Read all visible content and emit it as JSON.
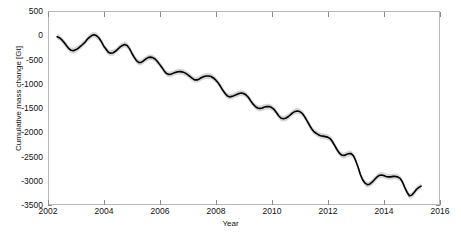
{
  "chart_data": {
    "type": "line",
    "title": "",
    "xlabel": "Year",
    "ylabel": "Cumulative mass change [Gt]",
    "xlim": [
      2002,
      2016
    ],
    "ylim": [
      -3500,
      500
    ],
    "xticks": [
      2002,
      2004,
      2006,
      2008,
      2010,
      2012,
      2014,
      2016
    ],
    "xtick_labels": [
      "2002",
      "2004",
      "2006",
      "2008",
      "2010",
      "2012",
      "2014",
      "2016"
    ],
    "yticks": [
      500,
      0,
      -500,
      -1000,
      -1500,
      -2000,
      -2500,
      -3000,
      -3500
    ],
    "ytick_labels": [
      "500",
      "0",
      "-500",
      "-1000",
      "-1500",
      "-2000",
      "-2500",
      "-3000",
      "-3500"
    ],
    "grid": false,
    "legend": null,
    "line_color": "#000000",
    "uncertainty_band_color": "#bdbdbd",
    "series": [
      {
        "name": "Cumulative mass change",
        "uncertainty": 60,
        "x": [
          2002.29,
          2002.37,
          2002.45,
          2002.54,
          2002.62,
          2002.7,
          2002.79,
          2002.87,
          2002.95,
          2003.04,
          2003.12,
          2003.2,
          2003.29,
          2003.37,
          2003.45,
          2003.54,
          2003.62,
          2003.7,
          2003.79,
          2003.87,
          2003.95,
          2004.04,
          2004.12,
          2004.2,
          2004.29,
          2004.37,
          2004.45,
          2004.54,
          2004.62,
          2004.7,
          2004.79,
          2004.87,
          2004.95,
          2005.04,
          2005.12,
          2005.2,
          2005.29,
          2005.37,
          2005.45,
          2005.54,
          2005.62,
          2005.7,
          2005.79,
          2005.87,
          2005.95,
          2006.04,
          2006.12,
          2006.2,
          2006.29,
          2006.37,
          2006.45,
          2006.54,
          2006.62,
          2006.7,
          2006.79,
          2006.87,
          2006.95,
          2007.04,
          2007.12,
          2007.2,
          2007.29,
          2007.37,
          2007.45,
          2007.54,
          2007.62,
          2007.7,
          2007.79,
          2007.87,
          2007.95,
          2008.04,
          2008.12,
          2008.2,
          2008.29,
          2008.37,
          2008.45,
          2008.54,
          2008.62,
          2008.7,
          2008.79,
          2008.87,
          2008.95,
          2009.04,
          2009.12,
          2009.2,
          2009.29,
          2009.37,
          2009.45,
          2009.54,
          2009.62,
          2009.7,
          2009.79,
          2009.87,
          2009.95,
          2010.04,
          2010.12,
          2010.2,
          2010.29,
          2010.37,
          2010.45,
          2010.54,
          2010.62,
          2010.7,
          2010.79,
          2010.87,
          2010.95,
          2011.04,
          2011.12,
          2011.2,
          2011.29,
          2011.37,
          2011.45,
          2011.54,
          2011.62,
          2011.7,
          2011.79,
          2011.87,
          2011.95,
          2012.04,
          2012.12,
          2012.2,
          2012.29,
          2012.37,
          2012.45,
          2012.54,
          2012.62,
          2012.7,
          2012.79,
          2012.87,
          2012.95,
          2013.04,
          2013.12,
          2013.2,
          2013.29,
          2013.37,
          2013.45,
          2013.54,
          2013.62,
          2013.7,
          2013.79,
          2013.87,
          2013.95,
          2014.04,
          2014.12,
          2014.2,
          2014.29,
          2014.37,
          2014.45,
          2014.54,
          2014.62,
          2014.7,
          2014.79,
          2014.87,
          2014.95,
          2015.04,
          2015.12,
          2015.2,
          2015.29
        ],
        "values": [
          -10,
          -30,
          -70,
          -130,
          -190,
          -250,
          -290,
          -300,
          -280,
          -250,
          -210,
          -170,
          -120,
          -60,
          -20,
          20,
          30,
          10,
          -40,
          -110,
          -200,
          -270,
          -330,
          -350,
          -340,
          -310,
          -270,
          -220,
          -190,
          -170,
          -190,
          -250,
          -340,
          -430,
          -500,
          -540,
          -540,
          -510,
          -470,
          -440,
          -430,
          -440,
          -470,
          -520,
          -580,
          -650,
          -720,
          -770,
          -790,
          -780,
          -760,
          -740,
          -730,
          -730,
          -740,
          -760,
          -790,
          -830,
          -870,
          -900,
          -900,
          -880,
          -850,
          -830,
          -820,
          -820,
          -830,
          -860,
          -900,
          -960,
          -1030,
          -1110,
          -1180,
          -1230,
          -1250,
          -1240,
          -1220,
          -1200,
          -1180,
          -1170,
          -1180,
          -1210,
          -1260,
          -1330,
          -1400,
          -1450,
          -1480,
          -1490,
          -1480,
          -1460,
          -1450,
          -1450,
          -1470,
          -1510,
          -1570,
          -1640,
          -1690,
          -1700,
          -1690,
          -1660,
          -1620,
          -1580,
          -1550,
          -1540,
          -1550,
          -1590,
          -1650,
          -1730,
          -1820,
          -1900,
          -1960,
          -2000,
          -2030,
          -2050,
          -2060,
          -2070,
          -2080,
          -2110,
          -2170,
          -2250,
          -2340,
          -2410,
          -2450,
          -2460,
          -2440,
          -2420,
          -2420,
          -2460,
          -2560,
          -2700,
          -2850,
          -2960,
          -3030,
          -3060,
          -3050,
          -3010,
          -2960,
          -2910,
          -2870,
          -2860,
          -2870,
          -2890,
          -2900,
          -2900,
          -2890,
          -2890,
          -2900,
          -2930,
          -3000,
          -3110,
          -3220,
          -3290,
          -3280,
          -3220,
          -3160,
          -3120,
          -3090
        ]
      }
    ]
  }
}
